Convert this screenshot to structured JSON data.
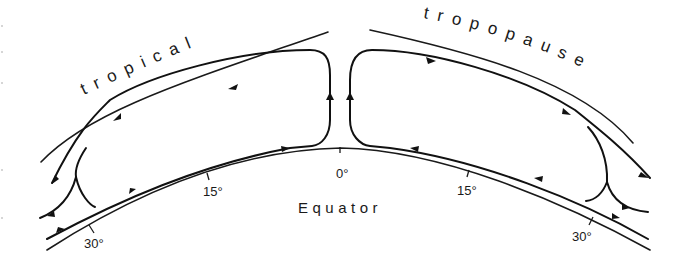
{
  "diagram": {
    "title_words": {
      "left": "tropical",
      "right": "tropopause"
    },
    "equator_label": "Equator",
    "latitude_ticks": [
      {
        "side": "left",
        "label": "30°"
      },
      {
        "side": "left",
        "label": "15°"
      },
      {
        "side": "center",
        "label": "0°"
      },
      {
        "side": "right",
        "label": "15°"
      },
      {
        "side": "right",
        "label": "30°"
      }
    ],
    "colors": {
      "stroke": "#111111",
      "background": "#ffffff"
    },
    "elements": {
      "cells": [
        "left-hadley-cell",
        "right-hadley-cell"
      ],
      "flow_directions": {
        "upper_branch": "poleward",
        "lower_branch": "equatorward",
        "equator": "rising",
        "subtropics": "sinking"
      }
    }
  }
}
